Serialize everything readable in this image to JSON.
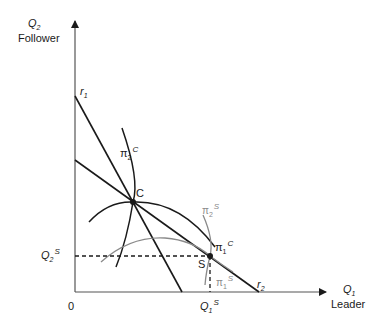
{
  "axes": {
    "y_axis": {
      "symbol": "Q",
      "subscript": "2",
      "name": "Follower"
    },
    "x_axis": {
      "symbol": "Q",
      "subscript": "1",
      "name": "Leader"
    },
    "origin": "0"
  },
  "reaction_curves": {
    "r1": {
      "symbol": "r",
      "subscript": "1"
    },
    "r2": {
      "symbol": "r",
      "subscript": "2"
    }
  },
  "isoprofit_curves": {
    "pi2C": {
      "symbol": "π",
      "subscript": "2",
      "superscript": "C",
      "color": "#1a1a1a"
    },
    "pi1C": {
      "symbol": "π",
      "subscript": "1",
      "superscript": "C",
      "color": "#1a1a1a"
    },
    "pi2S": {
      "symbol": "π",
      "subscript": "2",
      "superscript": "S",
      "color": "#8a8a8a"
    },
    "pi1S": {
      "symbol": "π",
      "subscript": "1",
      "superscript": "S",
      "color": "#8a8a8a"
    }
  },
  "points": {
    "C": {
      "label": "C"
    },
    "S": {
      "label": "S"
    }
  },
  "guides": {
    "Q2S": {
      "symbol": "Q",
      "subscript": "2",
      "superscript": "S"
    },
    "Q1S": {
      "symbol": "Q",
      "subscript": "1",
      "superscript": "S"
    }
  }
}
